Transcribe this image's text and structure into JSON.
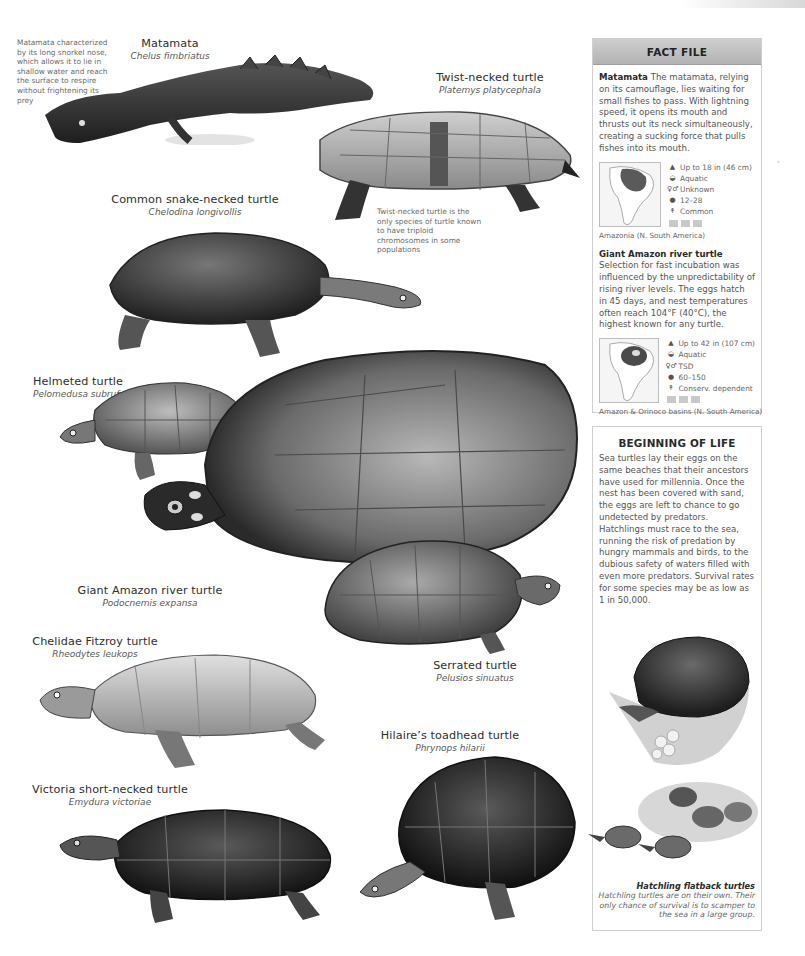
{
  "species": [
    {
      "id": "matamata",
      "common": "Matamata",
      "latin": "Chelus fimbriatus"
    },
    {
      "id": "twist-necked",
      "common": "Twist-necked turtle",
      "latin": "Platemys platycephala"
    },
    {
      "id": "common-snake-necked",
      "common": "Common snake-necked turtle",
      "latin": "Chelodina longivollis"
    },
    {
      "id": "helmeted",
      "common": "Helmeted turtle",
      "latin": "Pelomedusa subrufa"
    },
    {
      "id": "giant-amazon",
      "common": "Giant Amazon river turtle",
      "latin": "Podocnemis expansa"
    },
    {
      "id": "chelidae-fitzroy",
      "common": "Chelidae Fitzroy turtle",
      "latin": "Rheodytes leukops"
    },
    {
      "id": "serrated",
      "common": "Serrated turtle",
      "latin": "Pelusios sinuatus"
    },
    {
      "id": "hilaires-toadhead",
      "common": "Hilaire’s toadhead turtle",
      "latin": "Phrynops hilarii"
    },
    {
      "id": "victoria-short-necked",
      "common": "Victoria short-necked turtle",
      "latin": "Emydura victoriae"
    }
  ],
  "notes": {
    "matamata": "Matamata characterized by its long snorkel nose, which allows it to lie in shallow water and reach the surface to respire without frightening its prey",
    "twist_necked": "Twist-necked turtle is the only species of turtle known to have triploid chromosomes in some populations"
  },
  "fact_file": {
    "title": "FACT FILE",
    "entries": [
      {
        "name": "Matamata",
        "text": "The matamata, relying on its camouflage, lies waiting for small fishes to pass. With lightning speed, it opens its mouth and thrusts out its neck simultaneously, creating a sucking force that pulls fishes into its mouth.",
        "stats": [
          {
            "icon": "size-icon",
            "glyph": "▲",
            "value": "Up to 18 in (46 cm)"
          },
          {
            "icon": "habitat-icon",
            "glyph": "◒",
            "value": "Aquatic"
          },
          {
            "icon": "sex-icon",
            "glyph": "♀♂",
            "value": "Unknown"
          },
          {
            "icon": "egg-icon",
            "glyph": "●",
            "value": "12–28"
          },
          {
            "icon": "status-icon",
            "glyph": "↟",
            "value": "Common"
          }
        ],
        "region": "Amazonia (N. South America)"
      },
      {
        "name": "Giant Amazon river turtle",
        "text": "Selection for fast incubation was influenced by the unpredictability of rising river levels. The eggs hatch in 45 days, and nest temperatures often reach 104°F (40°C), the highest known for any turtle.",
        "stats": [
          {
            "icon": "size-icon",
            "glyph": "▲",
            "value": "Up to 42 in (107 cm)"
          },
          {
            "icon": "habitat-icon",
            "glyph": "◒",
            "value": "Aquatic"
          },
          {
            "icon": "sex-icon",
            "glyph": "♀♂",
            "value": "TSD"
          },
          {
            "icon": "egg-icon",
            "glyph": "●",
            "value": "60–150"
          },
          {
            "icon": "status-icon",
            "glyph": "↟",
            "value": "Conserv. dependent"
          }
        ],
        "region": "Amazon & Orinoco basins (N. South America)"
      }
    ]
  },
  "beginning_of_life": {
    "title": "BEGINNING OF LIFE",
    "text": "Sea turtles lay their eggs on the same beaches that their ancestors have used for millennia. Once the nest has been covered with sand, the eggs are left to chance to go undetected by predators. Hatchlings must race to the sea, running the risk of predation by hungry mammals and birds, to the dubious safety of waters filled with even more predators. Survival rates for some species may be as low as 1 in 50,000.",
    "caption_title": "Hatchling flatback turtles",
    "caption_text": "Hatchling turtles are on their own. Their only chance of survival is to scamper to the sea in a large group."
  },
  "colors": {
    "header_bar": "#c0c0c0",
    "panel_border": "#cfcfcf",
    "text": "#555555",
    "heading": "#2a2a2a"
  }
}
